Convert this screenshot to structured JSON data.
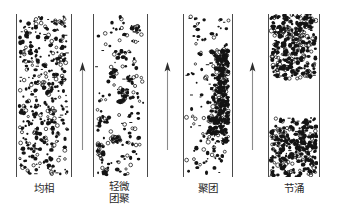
{
  "figure": {
    "background_color": "#ffffff",
    "wall_color": "#4a4a4a",
    "particle_color": "#141414",
    "arrow_color": "#8c8c8c",
    "caption_color": "#2b2b2b"
  },
  "panels": [
    {
      "id": "panel-uniform",
      "caption": "均相",
      "regime": "uniform-phase",
      "x": 16,
      "width": 56,
      "top": 14,
      "height": 163,
      "pattern": "uniform",
      "particle_count": 150,
      "description": "Evenly dispersed particles filling the whole column"
    },
    {
      "id": "panel-slight-agglomeration",
      "caption": "轻微\n团聚",
      "regime": "slight-agglomeration",
      "x": 93,
      "width": 55,
      "top": 14,
      "height": 163,
      "pattern": "clumped",
      "particle_count": 130,
      "description": "Particles beginning to form small loose clumps"
    },
    {
      "id": "panel-cluster",
      "caption": "聚团",
      "regime": "cluster",
      "x": 183,
      "width": 50,
      "top": 14,
      "height": 163,
      "pattern": "cluster-band",
      "particle_count": 120,
      "description": "Dense cluster strand along the right wall, dilute elsewhere"
    },
    {
      "id": "panel-slugging",
      "caption": "节涌",
      "regime": "slugging",
      "x": 268,
      "width": 52,
      "top": 14,
      "height": 163,
      "pattern": "slug-bands",
      "particle_count": 260,
      "bands": [
        {
          "top": 0,
          "height": 62
        },
        {
          "top": 106,
          "height": 57
        }
      ],
      "description": "Two dense particle slugs separated by a particle-free gap"
    }
  ],
  "arrows": [
    {
      "id": "arrow-1",
      "x": 82,
      "top": 62,
      "height": 88,
      "direction": "up",
      "meaning": "gas-flow-direction"
    },
    {
      "id": "arrow-2",
      "x": 167,
      "top": 62,
      "height": 88,
      "direction": "up",
      "meaning": "gas-flow-direction"
    },
    {
      "id": "arrow-3",
      "x": 252,
      "top": 62,
      "height": 88,
      "direction": "up",
      "meaning": "gas-flow-direction"
    }
  ],
  "captions": [
    {
      "id": "caption-1",
      "text": "均相",
      "x": 16,
      "width": 56,
      "top": 183
    },
    {
      "id": "caption-2",
      "text": "轻微\n团聚",
      "x": 90,
      "width": 58,
      "top": 181
    },
    {
      "id": "caption-3",
      "text": "聚团",
      "x": 183,
      "width": 50,
      "top": 183
    },
    {
      "id": "caption-4",
      "text": "节涌",
      "x": 266,
      "width": 56,
      "top": 183
    }
  ]
}
